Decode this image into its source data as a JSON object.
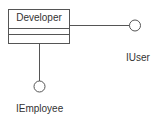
{
  "diagram": {
    "type": "uml-class-interface",
    "class": {
      "name": "Developer",
      "compartments": [
        "name",
        "attributes",
        "operations"
      ]
    },
    "interfaces": [
      {
        "name": "IUser",
        "position": "right"
      },
      {
        "name": "IEmployee",
        "position": "below"
      }
    ],
    "colors": {
      "stroke": "#555555",
      "text": "#333333",
      "background": "#ffffff"
    }
  }
}
